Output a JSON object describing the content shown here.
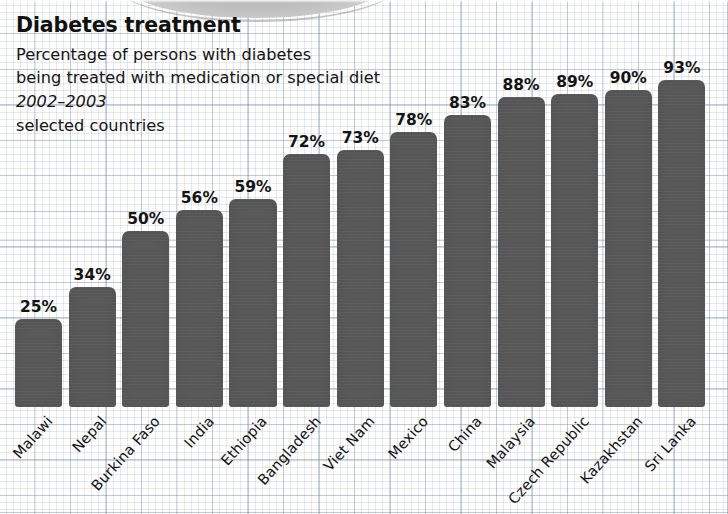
{
  "header": {
    "title": "Diabetes treatment",
    "subtitle_line1": "Percentage of persons with diabetes",
    "subtitle_line2": "being treated with medication or special diet",
    "period": "2002–2003",
    "note": "selected countries"
  },
  "style": {
    "bar_color": "#575757",
    "text_color": "#141414",
    "paper_color": "#fdfdfc",
    "grid_color": "#8792a6"
  },
  "chart_data": {
    "type": "bar",
    "title": "Diabetes treatment",
    "subtitle": "Percentage of persons with diabetes being treated with medication or special diet",
    "period": "2002–2003",
    "note": "selected countries",
    "xlabel": "",
    "ylabel": "",
    "ylim": [
      0,
      100
    ],
    "grid": true,
    "legend": "none",
    "unit": "%",
    "categories": [
      "Malawi",
      "Nepal",
      "Burkina Faso",
      "India",
      "Ethiopia",
      "Bangladesh",
      "Viet Nam",
      "Mexico",
      "China",
      "Malaysia",
      "Czech Republic",
      "Kazakhstan",
      "Sri Lanka"
    ],
    "values": [
      25,
      34,
      50,
      56,
      59,
      72,
      73,
      78,
      83,
      88,
      89,
      90,
      93
    ],
    "value_labels": [
      "25%",
      "34%",
      "50%",
      "56%",
      "59%",
      "72%",
      "73%",
      "78%",
      "83%",
      "88%",
      "89%",
      "90%",
      "93%"
    ]
  }
}
